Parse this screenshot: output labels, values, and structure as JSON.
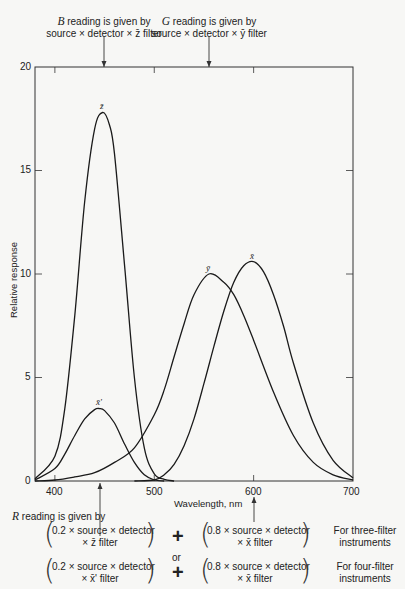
{
  "chart_data": {
    "type": "line",
    "title": "",
    "xlabel": "Wavelength, nm",
    "ylabel": "Relative response",
    "xlim": [
      380,
      700
    ],
    "ylim": [
      0,
      20
    ],
    "xticks": [
      400,
      500,
      600,
      700
    ],
    "yticks": [
      0,
      5,
      10,
      15,
      20
    ],
    "grid": false,
    "legend": "curve labels at peaks",
    "series": [
      {
        "name": "z̄",
        "label": "z̄",
        "peak": {
          "x": 448,
          "y": 17.8
        },
        "x": [
          380,
          400,
          410,
          420,
          430,
          440,
          448,
          455,
          460,
          470,
          480,
          490,
          500,
          510,
          520
        ],
        "y": [
          0.1,
          1.2,
          3.5,
          8.0,
          13.5,
          17.0,
          17.8,
          17.2,
          15.8,
          10.5,
          5.0,
          1.6,
          0.35,
          0.08,
          0
        ]
      },
      {
        "name": "x̄'",
        "label": "x̄'",
        "peak": {
          "x": 445,
          "y": 3.5
        },
        "x": [
          380,
          400,
          410,
          420,
          430,
          440,
          445,
          450,
          460,
          470,
          480,
          490,
          500,
          510
        ],
        "y": [
          0.05,
          0.6,
          1.3,
          2.2,
          3.0,
          3.45,
          3.5,
          3.4,
          2.8,
          1.8,
          0.9,
          0.3,
          0.05,
          0
        ]
      },
      {
        "name": "ȳ",
        "label": "ȳ",
        "peak": {
          "x": 555,
          "y": 10.0
        },
        "x": [
          380,
          400,
          420,
          440,
          460,
          480,
          500,
          510,
          520,
          530,
          540,
          555,
          570,
          580,
          590,
          600,
          620,
          640,
          660,
          680,
          700
        ],
        "y": [
          0,
          0.05,
          0.2,
          0.4,
          0.9,
          1.6,
          3.2,
          4.4,
          6.0,
          7.6,
          9.0,
          10.0,
          9.6,
          9.0,
          8.0,
          6.8,
          4.3,
          2.2,
          0.9,
          0.3,
          0.05
        ]
      },
      {
        "name": "x̄",
        "label": "x̄",
        "peak": {
          "x": 600,
          "y": 10.6
        },
        "x": [
          480,
          500,
          510,
          520,
          530,
          540,
          550,
          560,
          570,
          580,
          590,
          600,
          610,
          620,
          630,
          640,
          660,
          680,
          700
        ],
        "y": [
          0,
          0.05,
          0.3,
          0.8,
          1.7,
          3.0,
          4.7,
          6.5,
          8.2,
          9.6,
          10.4,
          10.6,
          10.1,
          9.0,
          7.5,
          5.7,
          2.8,
          1.0,
          0.15
        ]
      }
    ],
    "annotations": [
      {
        "text": "B reading is given by source × detector × z̄ filter",
        "arrow_x": 448
      },
      {
        "text": "G reading is given by source × detector × ȳ filter",
        "arrow_x": 555
      },
      {
        "text": "R reading is given by",
        "arrow_x": [
          448,
          600
        ]
      }
    ]
  },
  "top_notes": {
    "b": {
      "letter": "B",
      "line1": " reading is given by",
      "line2": "source × detector × z̄ filter"
    },
    "g": {
      "letter": "G",
      "line1": " reading is given by",
      "line2": "source × detector × ȳ filter"
    }
  },
  "axis": {
    "ylabel": "Relative response",
    "xlabel": "Wavelength, nm",
    "yticks": [
      "0",
      "5",
      "10",
      "15",
      "20"
    ],
    "xticks": [
      "400",
      "500",
      "600",
      "700"
    ]
  },
  "r_note": {
    "letter": "R",
    "rest": " reading is given by"
  },
  "formulas": {
    "row1": {
      "left_l1": "0.2 × source × detector",
      "left_l2": "× z̄ filter",
      "plus": "+",
      "right_l1": "0.8 × source × detector",
      "right_l2": "× x̄ filter",
      "note_l1": "For three-filter",
      "note_l2": "instruments"
    },
    "or": "or",
    "row2": {
      "left_l1": "0.2 × source × detector",
      "left_l2": "× x̄' filter",
      "plus": "+",
      "right_l1": "0.8 × source × detector",
      "right_l2": "× x̄ filter",
      "note_l1": "For four-filter",
      "note_l2": "instruments"
    }
  },
  "paren_open": "(",
  "paren_close": ")"
}
